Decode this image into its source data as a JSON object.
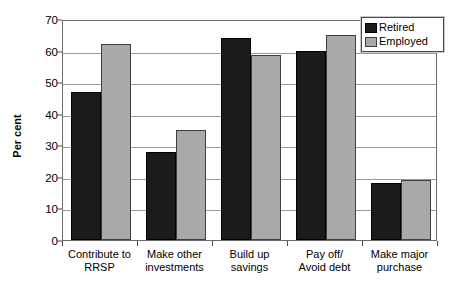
{
  "chart_data": {
    "type": "bar",
    "title": "",
    "subtitle": "",
    "xlabel": "",
    "ylabel": "Per cent",
    "ylim": [
      0,
      70
    ],
    "yticks": [
      0,
      10,
      20,
      30,
      40,
      50,
      60,
      70
    ],
    "ytick_labels": [
      "0",
      "10",
      "20",
      "30",
      "40",
      "50",
      "60",
      "70"
    ],
    "grid": "horizontal",
    "legend_position": "top-right",
    "categories": [
      "Contribute to RRSP",
      "Make other investments",
      "Build up savings",
      "Pay off/ Avoid debt",
      "Make major purchase"
    ],
    "category_lines": [
      [
        "Contribute to",
        "RRSP"
      ],
      [
        "Make other",
        "investments"
      ],
      [
        "Build up",
        "savings"
      ],
      [
        "Pay off/",
        "Avoid debt"
      ],
      [
        "Make major",
        "purchase"
      ]
    ],
    "series": [
      {
        "name": "Retired",
        "color": "#1b1b1b",
        "values": [
          47,
          28,
          64,
          60,
          18
        ]
      },
      {
        "name": "Employed",
        "color": "#a9a9a9",
        "values": [
          62,
          35,
          58.5,
          65,
          19
        ]
      }
    ]
  },
  "legend": {
    "entries": [
      {
        "label": "Retired",
        "swatch": "retired"
      },
      {
        "label": "Employed",
        "swatch": "employed"
      }
    ]
  },
  "colors": {
    "retired": "#1b1b1b",
    "employed": "#a9a9a9",
    "gridline": "#9a9a9a",
    "frame": "#6b6b6b",
    "background": "#ffffff",
    "text": "#000000"
  }
}
